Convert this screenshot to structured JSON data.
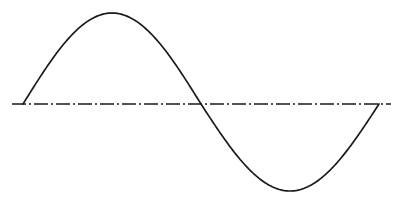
{
  "figure": {
    "title": "Sine wave"
  },
  "colors": {
    "background": "#ffffff",
    "curve": "#1a1a1a",
    "axis": "#1a1a1a"
  },
  "geometry": {
    "axis": {
      "x1": 12,
      "x2": 391,
      "y": 104,
      "dasharray": "14 3 2 3"
    },
    "wave": {
      "x_start": 23,
      "x_end": 379,
      "baseline_y": 104,
      "amplitude_up": 91,
      "amplitude_down": 87,
      "cycles": 1
    }
  }
}
